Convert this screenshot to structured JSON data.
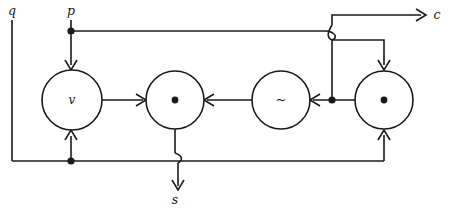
{
  "diagram": {
    "type": "logic-circuit",
    "background_color": "#ffffff",
    "line_color": "#1a1a1a",
    "gate_fill": "#ffffff"
  },
  "inputs": [
    {
      "id": "q",
      "label": "q",
      "x": 12,
      "y": 11
    },
    {
      "id": "p",
      "label": "p",
      "x": 71,
      "y": 11
    }
  ],
  "outputs": [
    {
      "id": "c",
      "label": "c",
      "x": 437,
      "y": 15
    },
    {
      "id": "s",
      "label": "s",
      "x": 175,
      "y": 200
    }
  ],
  "gates": [
    {
      "id": "g1",
      "symbol": "v",
      "kind": "or",
      "cx": 72,
      "cy": 100,
      "r": 30,
      "glyph_type": "text"
    },
    {
      "id": "g2",
      "symbol": "·",
      "kind": "and",
      "cx": 175,
      "cy": 100,
      "r": 29,
      "glyph_type": "dot"
    },
    {
      "id": "g3",
      "symbol": "~",
      "kind": "not",
      "cx": 281,
      "cy": 100,
      "r": 29,
      "glyph_type": "text"
    },
    {
      "id": "g4",
      "symbol": "·",
      "kind": "and",
      "cx": 384,
      "cy": 100,
      "r": 29,
      "glyph_type": "dot"
    }
  ],
  "junctions": [
    {
      "id": "j-p",
      "x": 71,
      "y": 31
    },
    {
      "id": "j-q",
      "x": 71,
      "y": 161
    },
    {
      "id": "j-c",
      "x": 332,
      "y": 100
    }
  ],
  "wires": [
    {
      "id": "w-p-down",
      "d": "M 71 20 L 71 65",
      "desc": "p input down into OR gate"
    },
    {
      "id": "w-p-right",
      "d": "M 71 31 L 327 31",
      "desc": "p branch right toward AND gate 4"
    },
    {
      "id": "w-p-hop",
      "d": "M 327 31 C 337 33, 337 38, 332 40",
      "desc": "hop over c vertical wire"
    },
    {
      "id": "w-p-right2",
      "d": "M 332 40 L 384 40 L 384 65",
      "desc": "continues right then down into AND gate 4"
    },
    {
      "id": "w-q-down",
      "d": "M 12 20 L 12 161",
      "desc": "q input down left side"
    },
    {
      "id": "w-q-right",
      "d": "M 12 161 L 384 161",
      "desc": "q bottom bus rightward"
    },
    {
      "id": "w-q-up-g1",
      "d": "M 71 161 L 71 136",
      "desc": "q branch up into OR gate bottom"
    },
    {
      "id": "w-q-up-g4",
      "d": "M 384 161 L 384 135",
      "desc": "bottom bus up into AND gate 4 bottom"
    },
    {
      "id": "w-g1-g2",
      "d": "M 102 100 L 143 100",
      "desc": "OR gate output into AND gate 2"
    },
    {
      "id": "w-g3-g2",
      "d": "M 252 100 L 207 100",
      "desc": "NOT gate output into AND gate 2"
    },
    {
      "id": "w-g4-g3",
      "d": "M 355 100 L 313 100",
      "desc": "AND gate 4 output into NOT gate"
    },
    {
      "id": "w-c-up",
      "d": "M 332 100 L 332 40",
      "desc": "c tap vertical up"
    },
    {
      "id": "w-c-hop",
      "d": "M 332 40 C 327 38, 327 33, 332 25",
      "desc": "hop continuation upward"
    },
    {
      "id": "w-c-top",
      "d": "M 332 25 L 332 15 L 421 15",
      "desc": "turns right to c output"
    },
    {
      "id": "w-s-down",
      "d": "M 175 129 L 175 153",
      "desc": "AND gate 2 output down to s"
    },
    {
      "id": "w-s-hop",
      "d": "M 175 153 C 183 156, 183 160, 178 163",
      "desc": "hop over q bottom bus"
    },
    {
      "id": "w-s-down2",
      "d": "M 178 163 L 178 186",
      "desc": "continues down to s output"
    }
  ],
  "arrowheads": [
    {
      "id": "a-p-g1",
      "d": "M 65 60 L 71 70 L 77 60",
      "desc": "into OR gate top"
    },
    {
      "id": "a-q-g1",
      "d": "M 65 140 L 71 130 L 77 140",
      "desc": "into OR gate bottom"
    },
    {
      "id": "a-g1-g2",
      "d": "M 136 94 L 146 100 L 136 106",
      "desc": "into AND gate 2 left"
    },
    {
      "id": "a-g3-g2",
      "d": "M 214 94 L 204 100 L 214 106",
      "desc": "into AND gate 2 right"
    },
    {
      "id": "a-g4-g3",
      "d": "M 320 94 L 310 100 L 320 106",
      "desc": "into NOT gate right"
    },
    {
      "id": "a-p-g4",
      "d": "M 378 60 L 384 70 L 390 60",
      "desc": "into AND gate 4 top"
    },
    {
      "id": "a-q-g4",
      "d": "M 378 140 L 384 130 L 390 140",
      "desc": "into AND gate 4 bottom"
    },
    {
      "id": "a-c-out",
      "d": "M 416 9 L 426 15 L 416 21",
      "desc": "c output arrow"
    },
    {
      "id": "a-s-out",
      "d": "M 172 180 L 178 190 L 184 180",
      "desc": "s output arrow"
    }
  ]
}
